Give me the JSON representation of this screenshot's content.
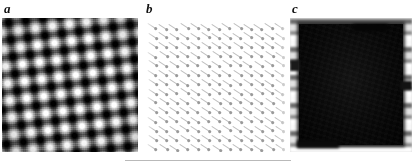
{
  "figure": {
    "width": 419,
    "height": 166,
    "background": "#ffffff",
    "kind": "three-panel microscopy figure",
    "panels": [
      {
        "id": "a",
        "label": "a",
        "name": "panel-a",
        "description": "grayscale checkerboard lattice micrograph",
        "x": 2,
        "y": 18,
        "width": 136,
        "height": 134,
        "colors": {
          "bright": "#fdfdfd",
          "dark": "#050505",
          "mid": "#6a6a6a"
        },
        "lattice_period_px": 17.2,
        "lattice_rotation_deg": -7
      },
      {
        "id": "b",
        "label": "b",
        "name": "panel-b",
        "description": "array of faint diagonal dashes on white",
        "x": 145,
        "y": 18,
        "width": 140,
        "height": 134,
        "colors": {
          "dash": "#bdbdbd",
          "dot": "#9a9a9a",
          "background": "#ffffff"
        },
        "dash_angle_deg": 33,
        "dash_length_px": 11,
        "dash_cols": 13,
        "dash_rows": 14,
        "dash_spacing_x_px": 10.6,
        "dash_spacing_y_px": 9.3
      },
      {
        "id": "c",
        "label": "c",
        "name": "panel-c",
        "description": "dark square with mottled bright border",
        "x": 290,
        "y": 18,
        "width": 122,
        "height": 134,
        "colors": {
          "core": "#0a0a0a",
          "border": "#c4c4c4",
          "highlight": "#ffffff"
        }
      }
    ],
    "labels": [
      {
        "text": "a",
        "x": 4,
        "y": 2,
        "name": "panel-label-a"
      },
      {
        "text": "b",
        "x": 146,
        "y": 2,
        "name": "panel-label-b"
      },
      {
        "text": "c",
        "x": 292,
        "y": 2,
        "name": "panel-label-c"
      }
    ],
    "rule": {
      "name": "scale-rule",
      "x": 125,
      "y": 160,
      "width": 166,
      "color": "#b9b9b9"
    }
  }
}
